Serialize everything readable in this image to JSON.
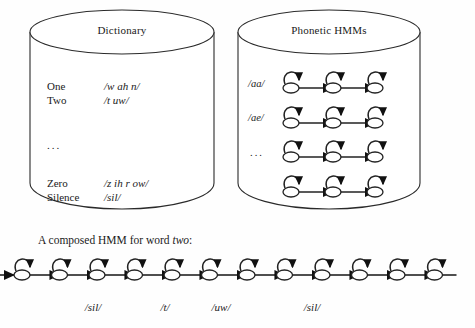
{
  "figure": {
    "stroke_color": "#1a1a1a",
    "fill_color": "#ffffff",
    "background": "#fefefe"
  },
  "dictionary": {
    "title": "Dictionary",
    "entries": [
      {
        "word": "One",
        "pron": "/w ah n/"
      },
      {
        "word": "Two",
        "pron": "/t uw/"
      }
    ],
    "ellipsis": "...",
    "entries2": [
      {
        "word": "Zero",
        "pron": "/z ih r ow/"
      },
      {
        "word": "Silence",
        "pron": "/sil/"
      }
    ]
  },
  "phonetic_hmms": {
    "title": "Phonetic HMMs",
    "rows": [
      {
        "label": "/aa/",
        "states": 3,
        "is_ellipsis": false
      },
      {
        "label": "/ae/",
        "states": 3,
        "is_ellipsis": false
      },
      {
        "label": "...",
        "states": 3,
        "is_ellipsis": true
      },
      {
        "label": "",
        "states": 3,
        "is_ellipsis": false
      }
    ]
  },
  "composed": {
    "caption_prefix": "A composed HMM for word ",
    "caption_word": "two",
    "caption_suffix": ":",
    "total_states": 12,
    "segments": [
      {
        "label": "/sil/",
        "states": 3
      },
      {
        "label": "/t/",
        "states": 3
      },
      {
        "label": "/uw/",
        "states": 3
      },
      {
        "label": "/sil/",
        "states": 3
      }
    ]
  }
}
